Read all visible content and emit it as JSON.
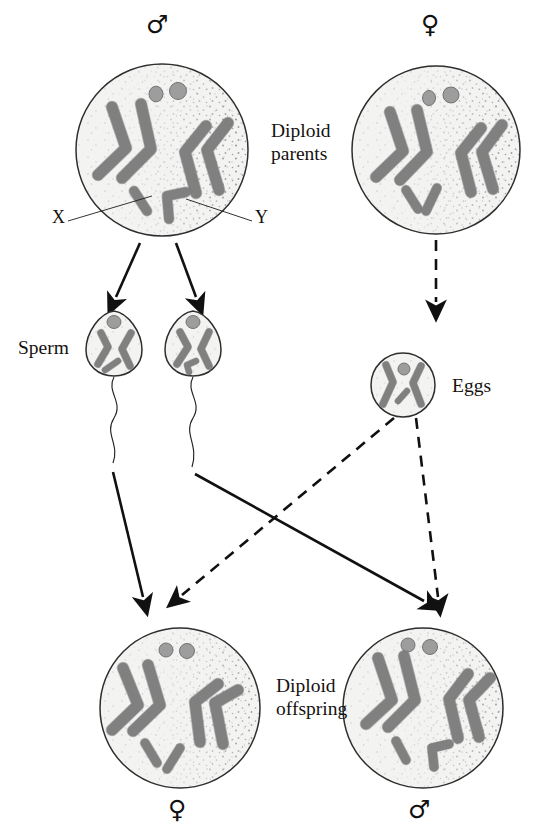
{
  "diagram": {
    "type": "genetics-inheritance-diagram",
    "colors": {
      "cell_fill": "#f2f2f0",
      "cell_stroke": "#2b2b2b",
      "chromosome_fill": "#9b9b9b",
      "chromosome_stroke": "#6e6e6e",
      "cytoplasm_stipple": "#8a8a8a",
      "arrow": "#111111",
      "text": "#15110f"
    }
  },
  "labels": {
    "diploid_parents": "Diploid\nparents",
    "diploid_offspring": "Diploid\noffspring",
    "sperm": "Sperm",
    "eggs": "Eggs",
    "x_chromosome": "X",
    "y_chromosome": "Y",
    "male_symbol": "♂",
    "female_symbol": "♀"
  },
  "cells": [
    {
      "id": "parent-male",
      "role": "diploid-parent",
      "sex": "male",
      "sex_symbol": "♂",
      "ploidy": "diploid",
      "sex_chromosomes": "XY",
      "autosome_pairs": 2,
      "nucleoli": 2,
      "shape": "circle",
      "callouts": [
        "X",
        "Y"
      ]
    },
    {
      "id": "parent-female",
      "role": "diploid-parent",
      "sex": "female",
      "sex_symbol": "♀",
      "ploidy": "diploid",
      "sex_chromosomes": "XX",
      "autosome_pairs": 2,
      "nucleoli": 2,
      "shape": "circle",
      "callouts": []
    },
    {
      "id": "sperm-x",
      "role": "gamete",
      "gamete_type": "sperm",
      "ploidy": "haploid",
      "sex_chromosomes": "X",
      "autosomes": 2,
      "shape": "teardrop-with-tail"
    },
    {
      "id": "sperm-y",
      "role": "gamete",
      "gamete_type": "sperm",
      "ploidy": "haploid",
      "sex_chromosomes": "Y",
      "autosomes": 2,
      "shape": "teardrop-with-tail"
    },
    {
      "id": "egg-x",
      "role": "gamete",
      "gamete_type": "egg",
      "ploidy": "haploid",
      "sex_chromosomes": "X",
      "autosomes": 2,
      "shape": "circle"
    },
    {
      "id": "offspring-female",
      "role": "diploid-offspring",
      "sex": "female",
      "sex_symbol": "♀",
      "ploidy": "diploid",
      "sex_chromosomes": "XX",
      "autosome_pairs": 2,
      "nucleoli": 2,
      "shape": "circle"
    },
    {
      "id": "offspring-male",
      "role": "diploid-offspring",
      "sex": "male",
      "sex_symbol": "♂",
      "ploidy": "diploid",
      "sex_chromosomes": "XY",
      "autosome_pairs": 2,
      "nucleoli": 2,
      "shape": "circle"
    }
  ],
  "arrows": [
    {
      "id": "male-to-sperm-x",
      "from": "parent-male",
      "to": "sperm-x",
      "style": "solid"
    },
    {
      "id": "male-to-sperm-y",
      "from": "parent-male",
      "to": "sperm-y",
      "style": "solid"
    },
    {
      "id": "female-to-egg",
      "from": "parent-female",
      "to": "egg-x",
      "style": "dashed"
    },
    {
      "id": "sperm-x-to-female-offspring",
      "from": "sperm-x",
      "to": "offspring-female",
      "style": "solid"
    },
    {
      "id": "sperm-y-to-male-offspring",
      "from": "sperm-y",
      "to": "offspring-male",
      "style": "solid"
    },
    {
      "id": "egg-to-female-offspring",
      "from": "egg-x",
      "to": "offspring-female",
      "style": "dashed"
    },
    {
      "id": "egg-to-male-offspring",
      "from": "egg-x",
      "to": "offspring-male",
      "style": "dashed"
    }
  ]
}
